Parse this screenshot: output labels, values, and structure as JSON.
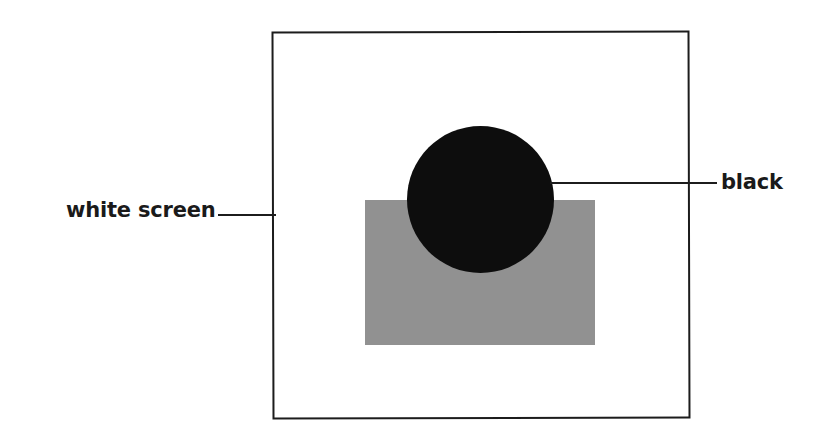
{
  "figure": {
    "width": 835,
    "height": 438,
    "background_color": "#ffffff"
  },
  "shapes": {
    "screen": {
      "name": "white screen",
      "fill_color": "#ffffff",
      "border_color": "#1c1c1c",
      "border_width": 2,
      "x": 272,
      "y": 31,
      "width": 418,
      "height": 388
    },
    "gray_rectangle": {
      "name": "gray rectangle",
      "fill_color": "#919191",
      "x": 365,
      "y": 200,
      "width": 230,
      "height": 145
    },
    "black_circle": {
      "name": "black disc",
      "fill_color": "#0d0d0d",
      "x": 407,
      "y": 126,
      "diameter": 147
    }
  },
  "callouts": [
    {
      "id": "white-screen",
      "label": "white screen",
      "side": "left",
      "line_color": "#1c1c1c"
    },
    {
      "id": "black",
      "label": "black",
      "side": "right",
      "line_color": "#1c1c1c"
    }
  ]
}
